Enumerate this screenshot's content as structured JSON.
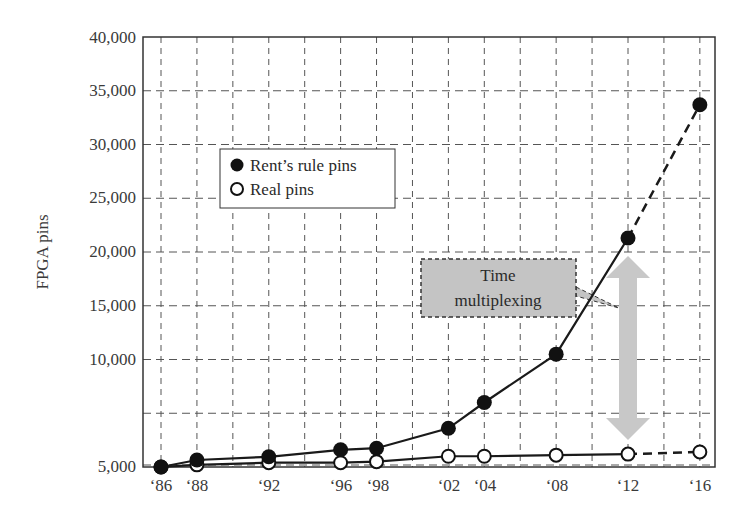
{
  "chart_data": {
    "type": "line",
    "title": "",
    "xlabel": "",
    "ylabel": "FPGA pins",
    "x": [
      "'86",
      "'88",
      "'92",
      "'96",
      "'98",
      "'02",
      "'04",
      "'08",
      "'12",
      "'16"
    ],
    "x_years": [
      1986,
      1988,
      1992,
      1996,
      1998,
      2002,
      2004,
      2008,
      2012,
      2016
    ],
    "series": [
      {
        "name": "Rent's rule pins",
        "marker": "filled-circle",
        "values": [
          0,
          650,
          950,
          1600,
          1750,
          3600,
          6000,
          10500,
          21300,
          33700
        ],
        "dashed_segment": [
          "'12",
          "'16"
        ]
      },
      {
        "name": "Real pins",
        "marker": "open-circle",
        "values": [
          0,
          200,
          400,
          400,
          500,
          1000,
          1000,
          1100,
          1200,
          1400
        ],
        "dashed_segment": [
          "'12",
          "'16"
        ]
      }
    ],
    "ylim": [
      0,
      40000
    ],
    "xlim": [
      1985,
      2017
    ],
    "y_ticks": [
      "5,000",
      "10,000",
      "15,000",
      "20,000",
      "25,000",
      "30,000",
      "35,000",
      "40,000"
    ],
    "y_tick_values": [
      5000,
      10000,
      15000,
      20000,
      25000,
      30000,
      35000,
      40000
    ],
    "grid": true,
    "grid_style": "dashed",
    "legend": {
      "position": "upper-left-inset",
      "entries": [
        "Rent's rule pins",
        "Real pins"
      ]
    },
    "annotations": [
      {
        "text_lines": [
          "Time",
          "multiplexing"
        ],
        "type": "callout-box",
        "points_to": "double-arrow between series at '12"
      },
      {
        "type": "double-arrow",
        "x": "'12",
        "from": 1200,
        "to": 21300,
        "color": "#c8c8c8"
      }
    ]
  },
  "legend": {
    "items": [
      {
        "label": "Rent’s rule pins"
      },
      {
        "label": "Real pins"
      }
    ]
  },
  "annotation": {
    "line1": "Time",
    "line2": "multiplexing"
  },
  "axis": {
    "ylabel": "FPGA pins",
    "yticks": [
      "5,000",
      "10,000",
      "15,000",
      "20,000",
      "25,000",
      "30,000",
      "35,000",
      "40,000"
    ],
    "xticks": [
      "‘86",
      "‘88",
      "‘92",
      "‘96",
      "‘98",
      "‘02",
      "‘04",
      "‘08",
      "‘12",
      "‘16"
    ]
  },
  "colors": {
    "line": "#1a1a1a",
    "grid": "#555555",
    "arrow": "#c8c8c8",
    "callout_fill": "#c4c4c4"
  }
}
